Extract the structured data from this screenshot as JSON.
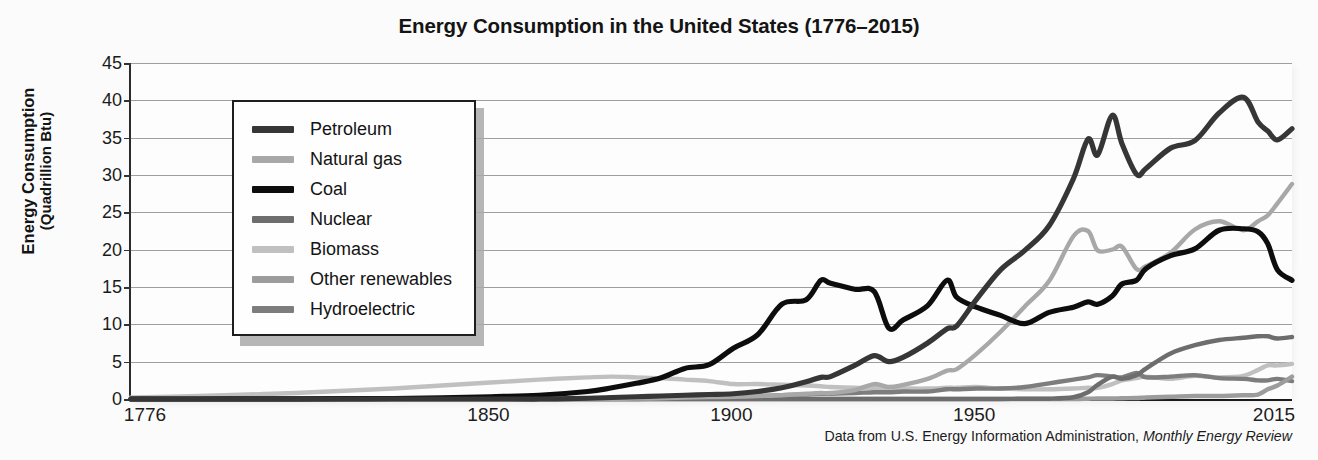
{
  "title": "Energy Consumption in the United States (1776–2015)",
  "source": {
    "text": "Data from U.S. Energy Information Administration, ",
    "italic": "Monthly Energy Review"
  },
  "axes": {
    "ylabel_main": "Energy Consumption",
    "ylabel_sub": "(Quadrillion Btu)",
    "yticks": [
      "45",
      "40",
      "35",
      "30",
      "25",
      "20",
      "15",
      "10",
      "5",
      "0"
    ],
    "xticks": [
      "1776",
      "1850",
      "1900",
      "1950",
      "2015"
    ]
  },
  "legend": [
    {
      "label": "Petroleum",
      "color": "#363636"
    },
    {
      "label": "Natural gas",
      "color": "#a8a8a8"
    },
    {
      "label": "Coal",
      "color": "#0d0d0d"
    },
    {
      "label": "Nuclear",
      "color": "#6d6d6d"
    },
    {
      "label": "Biomass",
      "color": "#c0c0c0"
    },
    {
      "label": "Other renewables",
      "color": "#9c9c9c"
    },
    {
      "label": "Hydroelectric",
      "color": "#7d7d7d"
    }
  ],
  "chart_data": {
    "type": "line",
    "title": "Energy Consumption in the United States (1776–2015)",
    "xlabel": "",
    "ylabel": "Energy Consumption (Quadrillion Btu)",
    "xlim": [
      1776,
      2015
    ],
    "ylim": [
      0,
      45
    ],
    "ytick_step": 5,
    "grid": true,
    "legend_position": "upper-left-inside",
    "source_note": "Data from U.S. Energy Information Administration, Monthly Energy Review",
    "x": [
      1776,
      1790,
      1800,
      1810,
      1820,
      1830,
      1840,
      1850,
      1860,
      1870,
      1875,
      1880,
      1885,
      1890,
      1895,
      1900,
      1905,
      1910,
      1915,
      1918,
      1920,
      1925,
      1929,
      1932,
      1935,
      1940,
      1944,
      1946,
      1950,
      1955,
      1960,
      1965,
      1970,
      1973,
      1975,
      1978,
      1980,
      1983,
      1985,
      1990,
      1995,
      2000,
      2005,
      2008,
      2010,
      2012,
      2015
    ],
    "series": [
      {
        "name": "Petroleum",
        "color": "#363636",
        "values": [
          0,
          0,
          0,
          0,
          0,
          0,
          0,
          0,
          0,
          0.1,
          0.2,
          0.3,
          0.4,
          0.5,
          0.6,
          0.7,
          1.0,
          1.5,
          2.3,
          2.9,
          3.0,
          4.5,
          5.8,
          5.0,
          5.6,
          7.5,
          9.4,
          9.8,
          13.3,
          17.3,
          19.9,
          23.2,
          29.5,
          34.8,
          32.7,
          38.0,
          34.2,
          30.1,
          30.9,
          33.6,
          34.6,
          38.3,
          40.4,
          37.1,
          35.9,
          34.7,
          36.2
        ]
      },
      {
        "name": "Natural gas",
        "color": "#a8a8a8",
        "values": [
          0,
          0,
          0,
          0,
          0,
          0,
          0,
          0,
          0,
          0,
          0,
          0.05,
          0.1,
          0.2,
          0.25,
          0.3,
          0.4,
          0.5,
          0.7,
          0.8,
          0.8,
          1.2,
          2.0,
          1.6,
          1.9,
          2.7,
          3.8,
          4.0,
          6.0,
          9.0,
          12.4,
          15.8,
          21.8,
          22.5,
          19.9,
          20.0,
          20.4,
          17.4,
          17.8,
          19.6,
          22.7,
          23.8,
          22.6,
          23.8,
          24.6,
          26.2,
          28.8
        ]
      },
      {
        "name": "Coal",
        "color": "#0d0d0d",
        "values": [
          0,
          0,
          0.01,
          0.02,
          0.04,
          0.07,
          0.15,
          0.3,
          0.5,
          1.0,
          1.5,
          2.1,
          2.8,
          4.1,
          4.6,
          6.8,
          8.6,
          12.7,
          13.3,
          15.9,
          15.5,
          14.7,
          14.4,
          9.5,
          10.6,
          12.5,
          15.9,
          13.6,
          12.3,
          11.2,
          10.1,
          11.6,
          12.3,
          13.0,
          12.7,
          13.8,
          15.4,
          15.9,
          17.5,
          19.2,
          20.1,
          22.6,
          22.8,
          22.4,
          20.8,
          17.3,
          15.9
        ]
      },
      {
        "name": "Nuclear",
        "color": "#6d6d6d",
        "values": [
          0,
          0,
          0,
          0,
          0,
          0,
          0,
          0,
          0,
          0,
          0,
          0,
          0,
          0,
          0,
          0,
          0,
          0,
          0,
          0,
          0,
          0,
          0,
          0,
          0,
          0,
          0,
          0,
          0,
          0,
          0.04,
          0.04,
          0.24,
          0.91,
          1.9,
          3.0,
          2.7,
          3.2,
          4.1,
          6.1,
          7.2,
          7.9,
          8.2,
          8.4,
          8.4,
          8.1,
          8.3
        ]
      },
      {
        "name": "Biomass",
        "color": "#c0c0c0",
        "values": [
          0.2,
          0.4,
          0.6,
          0.8,
          1.1,
          1.4,
          1.8,
          2.2,
          2.6,
          2.9,
          3.0,
          2.9,
          2.8,
          2.6,
          2.4,
          2.0,
          2.0,
          1.9,
          1.8,
          1.7,
          1.6,
          1.5,
          1.5,
          1.4,
          1.4,
          1.4,
          1.5,
          1.5,
          1.6,
          1.4,
          1.3,
          1.3,
          1.4,
          1.5,
          1.5,
          2.0,
          2.5,
          2.8,
          3.0,
          2.7,
          3.1,
          2.9,
          3.1,
          3.9,
          4.5,
          4.5,
          4.7
        ]
      },
      {
        "name": "Other renewables",
        "color": "#9c9c9c",
        "values": [
          0,
          0,
          0,
          0,
          0,
          0,
          0,
          0,
          0,
          0,
          0,
          0,
          0,
          0,
          0,
          0,
          0,
          0,
          0,
          0,
          0,
          0,
          0,
          0,
          0,
          0,
          0,
          0,
          0,
          0,
          0,
          0,
          0,
          0.04,
          0.07,
          0.07,
          0.11,
          0.13,
          0.2,
          0.3,
          0.4,
          0.4,
          0.5,
          0.6,
          1.3,
          1.8,
          3.0
        ]
      },
      {
        "name": "Hydroelectric",
        "color": "#7d7d7d",
        "values": [
          0,
          0,
          0,
          0,
          0,
          0,
          0,
          0,
          0,
          0,
          0,
          0.01,
          0.02,
          0.03,
          0.05,
          0.25,
          0.4,
          0.5,
          0.6,
          0.7,
          0.7,
          0.8,
          0.9,
          0.9,
          1.0,
          1.0,
          1.3,
          1.3,
          1.4,
          1.4,
          1.6,
          2.1,
          2.6,
          2.9,
          3.2,
          3.0,
          2.9,
          3.5,
          2.9,
          3.0,
          3.2,
          2.8,
          2.7,
          2.5,
          2.5,
          2.7,
          2.4
        ]
      }
    ]
  }
}
